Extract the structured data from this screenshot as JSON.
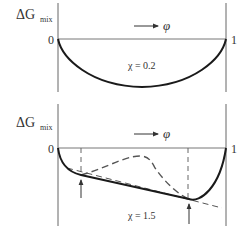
{
  "colors": {
    "axis": "#666666",
    "curve": "#1a1a1a",
    "dashed": "#555555",
    "text": "#333333"
  },
  "top_panel": {
    "ylabel_main": "ΔG",
    "ylabel_sub": "mix",
    "xaxis_arrow_label": "φ",
    "x_start_label": "0",
    "x_end_label": "1",
    "chi_label": "χ = 0.2"
  },
  "bottom_panel": {
    "ylabel_main": "ΔG",
    "ylabel_sub": "mix",
    "xaxis_arrow_label": "φ",
    "x_start_label": "0",
    "x_end_label": "1",
    "chi_label": "χ = 1.5"
  }
}
